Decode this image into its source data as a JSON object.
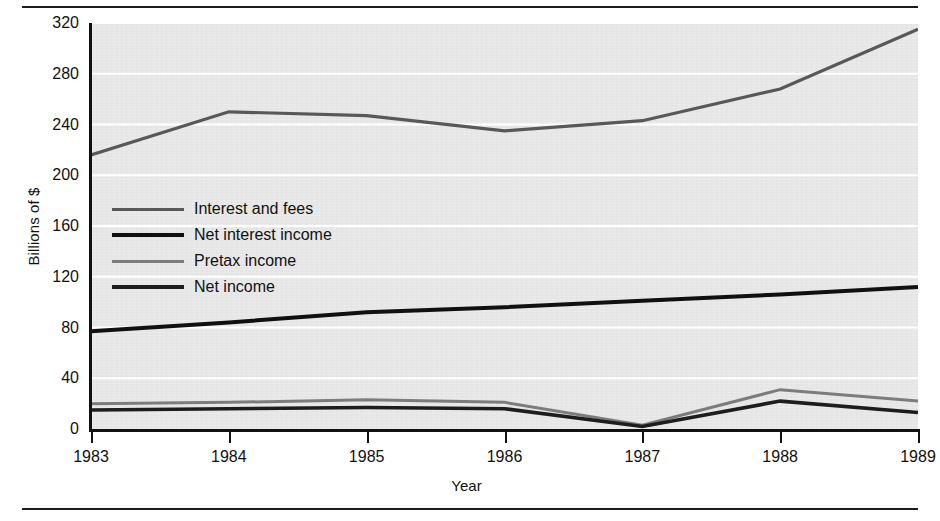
{
  "chart_data": {
    "type": "line",
    "title": "",
    "xlabel": "Year",
    "ylabel": "Billions of $",
    "x": [
      1983,
      1984,
      1985,
      1986,
      1987,
      1988,
      1989
    ],
    "xticklabels": [
      "1983",
      "1984",
      "1985",
      "1986",
      "1987",
      "1988",
      "1989"
    ],
    "yticklabels": [
      "0",
      "40",
      "80",
      "120",
      "160",
      "200",
      "240",
      "280",
      "320"
    ],
    "yticks": [
      0,
      40,
      80,
      120,
      160,
      200,
      240,
      280,
      320
    ],
    "ylim": [
      0,
      320
    ],
    "xlim": [
      1983,
      1989
    ],
    "grid": "horizontal-white",
    "legend_position": "inside-upper-left",
    "series": [
      {
        "name": "Interest and fees",
        "values": [
          216,
          250,
          247,
          235,
          243,
          268,
          315
        ],
        "color": "#58585a"
      },
      {
        "name": "Net interest income",
        "values": [
          77,
          84,
          92,
          96,
          101,
          106,
          112
        ],
        "color": "#101010"
      },
      {
        "name": "Pretax income",
        "values": [
          20,
          21,
          23,
          21,
          3,
          31,
          22
        ],
        "color": "#7c7c7e"
      },
      {
        "name": "Net income",
        "values": [
          15,
          16,
          17,
          16,
          2,
          22,
          13
        ],
        "color": "#1d1d1d"
      }
    ]
  },
  "legend": {
    "items": [
      {
        "label": "Interest and fees"
      },
      {
        "label": "Net interest income"
      },
      {
        "label": "Pretax income"
      },
      {
        "label": "Net income"
      }
    ]
  },
  "axes": {
    "y_title": "Billions of $",
    "x_title": "Year"
  }
}
